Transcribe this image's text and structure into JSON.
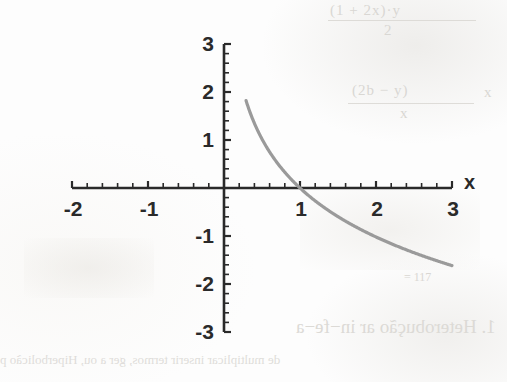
{
  "page": {
    "kind": "scanned-textbook-figure",
    "width": 507,
    "height": 382,
    "background_color": "#fdfdfd"
  },
  "figure": {
    "axis_color": "#2a2a2a",
    "curve_color": "#9a9a9a",
    "x_axis_label": "x",
    "y_axis_label": ""
  },
  "bleed_through": {
    "note": "faint show-through text from the reverse page, partly mirrored",
    "color": "#d9d7d3",
    "fragments": [
      {
        "id": "frac1_num",
        "text": "(1 + 2x)·y"
      },
      {
        "id": "frac1_den",
        "text": "2"
      },
      {
        "id": "frac2_num",
        "text": "(2b − y)"
      },
      {
        "id": "frac2_den",
        "text": "x"
      },
      {
        "id": "frac2_eq",
        "text": "x"
      },
      {
        "id": "small",
        "text": "= 117"
      },
      {
        "id": "heading",
        "text": "1. Heterobução ar in−fe−a"
      },
      {
        "id": "body",
        "text": "de multiplicar inserir termos, ger a ou, Hiperbolicão p"
      }
    ]
  },
  "chart_data": {
    "type": "line",
    "title": "",
    "subtitle": "",
    "xlabel": "x",
    "ylabel": "",
    "grid": false,
    "legend": null,
    "xlim": [
      -2,
      3
    ],
    "ylim": [
      -3,
      3
    ],
    "x_ticks_major": [
      -2,
      -1,
      0,
      1,
      2,
      3
    ],
    "x_tick_labels": [
      "-2",
      "-1",
      "",
      "1",
      "2",
      "3"
    ],
    "y_ticks_major": [
      -3,
      -2,
      -1,
      0,
      1,
      2,
      3
    ],
    "y_tick_labels": [
      "-3",
      "-2",
      "-1",
      "",
      "1",
      "2",
      "3"
    ],
    "minor_tick_step": 0.2,
    "series": [
      {
        "name": "y = log_(1/a)(x)",
        "description": "decreasing logarithmic curve, vertical asymptote at x = 0, crosses x-axis at x = 1",
        "color": "#9a9a9a",
        "x_domain": [
          0.29,
          3.0
        ],
        "x": [
          0.29,
          0.33,
          0.38,
          0.44,
          0.5,
          0.58,
          0.66,
          0.75,
          0.85,
          1.0,
          1.15,
          1.3,
          1.5,
          1.7,
          1.9,
          2.1,
          2.3,
          2.5,
          2.7,
          2.85,
          3.0
        ],
        "y": [
          3.05,
          2.86,
          2.68,
          2.49,
          2.3,
          2.08,
          1.86,
          1.67,
          1.49,
          1.24,
          1.07,
          0.91,
          0.7,
          0.52,
          0.36,
          0.22,
          0.09,
          -0.02,
          -0.12,
          -0.2,
          -0.28
        ]
      }
    ],
    "curve_y_at_x": {
      "1": 0,
      "2": -1.02,
      "3": -1.35
    },
    "annotations": []
  }
}
